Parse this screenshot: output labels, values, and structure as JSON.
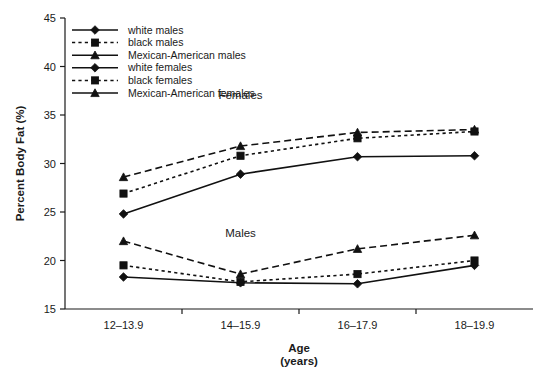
{
  "chart_data": {
    "type": "line",
    "title": "",
    "xlabel": "Age",
    "xlabel_sub": "(years)",
    "ylabel": "Percent Body Fat (%)",
    "categories": [
      "12–13.9",
      "14–15.9",
      "16–17.9",
      "18–19.9"
    ],
    "ylim": [
      15,
      45
    ],
    "yticks": [
      15,
      20,
      25,
      30,
      35,
      40,
      45
    ],
    "grid": false,
    "legend_position": "top-left",
    "annotations": [
      {
        "text": "Females",
        "x_category": "14–15.9",
        "y_value": 36.6
      },
      {
        "text": "Males",
        "x_category": "14–15.9",
        "y_value": 22.4
      }
    ],
    "series": [
      {
        "name": "white males",
        "group": "Males",
        "line_style": "solid",
        "marker": "diamond",
        "values": [
          18.3,
          17.7,
          17.6,
          19.5
        ]
      },
      {
        "name": "black males",
        "group": "Males",
        "line_style": "dotted",
        "marker": "square",
        "values": [
          19.5,
          17.8,
          18.6,
          20.0
        ]
      },
      {
        "name": "Mexican-American males",
        "group": "Males",
        "line_style": "dashed",
        "marker": "triangle",
        "values": [
          22.0,
          18.6,
          21.2,
          22.6
        ]
      },
      {
        "name": "white females",
        "group": "Females",
        "line_style": "solid",
        "marker": "diamond",
        "values": [
          24.8,
          28.9,
          30.7,
          30.8
        ]
      },
      {
        "name": "black females",
        "group": "Females",
        "line_style": "dotted",
        "marker": "square",
        "values": [
          26.9,
          30.8,
          32.6,
          33.3
        ]
      },
      {
        "name": "Mexican-American females",
        "group": "Females",
        "line_style": "dashed",
        "marker": "triangle",
        "values": [
          28.6,
          31.8,
          33.2,
          33.5
        ]
      }
    ]
  },
  "legend": {
    "items": [
      {
        "label": "white males",
        "line_style": "solid",
        "marker": "diamond"
      },
      {
        "label": "black males",
        "line_style": "dotted",
        "marker": "square"
      },
      {
        "label": "Mexican-American males",
        "line_style": "solid",
        "marker": "triangle"
      },
      {
        "label": "white females",
        "line_style": "solid",
        "marker": "diamond"
      },
      {
        "label": "black females",
        "line_style": "dotted",
        "marker": "square"
      },
      {
        "label": "Mexican-American females",
        "line_style": "solid",
        "marker": "triangle"
      }
    ]
  },
  "colors": {
    "ink": "#111111",
    "background": "#ffffff"
  }
}
